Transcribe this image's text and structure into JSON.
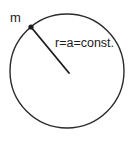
{
  "figure": {
    "kind": "circular-motion-diagram",
    "width": 133,
    "height": 143,
    "background_color": "#ffffff"
  },
  "labels": {
    "mass": "m",
    "radius_equation": "r=a=const."
  },
  "geometry": {
    "circle": {
      "center_x": 67,
      "center_y": 71,
      "radius": 57,
      "stroke_color": "#2b2b2b",
      "stroke_width": 1.4,
      "fill": "none"
    },
    "particle_point": {
      "x": 31,
      "y": 27,
      "size": 4,
      "color": "#1c1c1c"
    },
    "radius_line": {
      "x1": 31,
      "y1": 27,
      "x2": 69,
      "y2": 73,
      "stroke_color": "#1c1c1c",
      "stroke_width": 1.8
    },
    "mass_label_pos": {
      "x": 10,
      "y": 22
    },
    "radius_label_pos": {
      "x": 55,
      "y": 47
    }
  }
}
